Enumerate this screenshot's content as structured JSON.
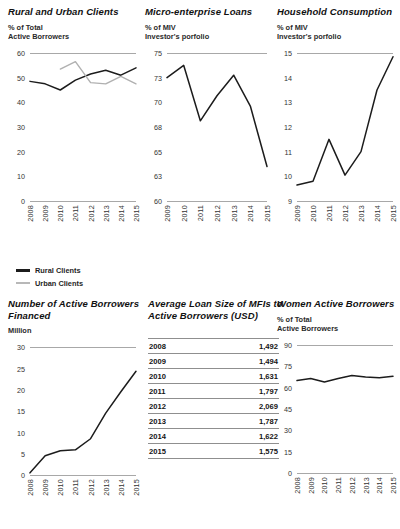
{
  "charts": {
    "rural_urban": {
      "title": "Rural and Urban Clients",
      "subtitle": "% of Total\nActive Borrowers",
      "legend": [
        {
          "label": "Rural Clients",
          "color": "#1c1c1c"
        },
        {
          "label": "Urban Clients",
          "color": "#b0b0b0"
        }
      ]
    },
    "micro_loans": {
      "title": "Micro-enterprise Loans",
      "subtitle": "% of MIV\nInvestor's porfolio"
    },
    "household": {
      "title": "Household Consumption",
      "subtitle": "% of MIV\nInvestor's porfolio"
    },
    "borrowers": {
      "title": "Number of Active Borrowers\nFinanced",
      "subtitle": "Million"
    },
    "women": {
      "title": "Women Active Borrowers",
      "subtitle": "% of Total\nActive Borrowers"
    },
    "loan_size": {
      "title": "Average Loan Size of MFIs to\nActive Borrowers (USD)"
    }
  },
  "chart_data": [
    {
      "id": "rural_urban",
      "type": "line",
      "title": "Rural and Urban Clients",
      "xlabel": "",
      "ylabel": "% of Total Active Borrowers",
      "x": [
        "2008",
        "2009",
        "2010",
        "2011",
        "2012",
        "2013",
        "2014",
        "2015"
      ],
      "yticks": [
        0,
        10,
        20,
        30,
        40,
        50,
        60
      ],
      "ylim": [
        0,
        60
      ],
      "grid": false,
      "legend_position": "below",
      "series": [
        {
          "name": "Rural Clients",
          "color": "#1c1c1c",
          "values": [
            48.5,
            47.5,
            45.0,
            49.0,
            51.5,
            53.0,
            51.0,
            54.0
          ]
        },
        {
          "name": "Urban Clients",
          "color": "#b0b0b0",
          "values": [
            null,
            null,
            53.5,
            56.5,
            48.0,
            47.5,
            50.5,
            47.5
          ]
        }
      ]
    },
    {
      "id": "micro_loans",
      "type": "line",
      "title": "Micro-enterprise Loans",
      "xlabel": "",
      "ylabel": "% of MIV Investor's porfolio",
      "x": [
        "2009",
        "2010",
        "2011",
        "2012",
        "2013",
        "2014",
        "2015"
      ],
      "yticks": [
        60,
        63,
        65,
        68,
        70,
        73,
        75
      ],
      "ylim": [
        60,
        75
      ],
      "grid": false,
      "series": [
        {
          "name": "Micro-enterprise Loans",
          "color": "#1c1c1c",
          "values": [
            73.0,
            74.0,
            68.5,
            70.8,
            73.2,
            69.7,
            63.8
          ]
        }
      ]
    },
    {
      "id": "household",
      "type": "line",
      "title": "Household Consumption",
      "xlabel": "",
      "ylabel": "% of MIV Investor's porfolio",
      "x": [
        "2009",
        "2010",
        "2011",
        "2012",
        "2013",
        "2014",
        "2015"
      ],
      "yticks": [
        9,
        10,
        11,
        12,
        13,
        14,
        15
      ],
      "ylim": [
        9,
        15
      ],
      "grid": false,
      "series": [
        {
          "name": "Household Consumption",
          "color": "#1c1c1c",
          "values": [
            9.65,
            9.8,
            11.5,
            10.05,
            11.0,
            13.5,
            14.85
          ]
        }
      ]
    },
    {
      "id": "borrowers",
      "type": "line",
      "title": "Number of Active Borrowers Financed",
      "xlabel": "",
      "ylabel": "Million",
      "x": [
        "2008",
        "2009",
        "2010",
        "2011",
        "2012",
        "2013",
        "2014",
        "2015"
      ],
      "yticks": [
        0,
        5,
        10,
        15,
        20,
        25,
        30
      ],
      "ylim": [
        0,
        30
      ],
      "grid": false,
      "series": [
        {
          "name": "Active Borrowers Financed",
          "color": "#1c1c1c",
          "values": [
            0.5,
            4.5,
            5.7,
            5.9,
            8.5,
            14.5,
            19.5,
            24.3
          ]
        }
      ]
    },
    {
      "id": "women",
      "type": "line",
      "title": "Women Active Borrowers",
      "xlabel": "",
      "ylabel": "% of Total Active Borrowers",
      "x": [
        "2008",
        "2009",
        "2010",
        "2011",
        "2012",
        "2013",
        "2014",
        "2015"
      ],
      "yticks": [
        0,
        15,
        30,
        45,
        60,
        75,
        90
      ],
      "ylim": [
        0,
        90
      ],
      "grid": false,
      "series": [
        {
          "name": "Women Active Borrowers",
          "color": "#1c1c1c",
          "values": [
            65.0,
            66.5,
            64.0,
            66.5,
            68.5,
            67.5,
            67.0,
            68.0
          ]
        }
      ]
    },
    {
      "id": "loan_size",
      "type": "table",
      "title": "Average Loan Size of MFIs to Active Borrowers (USD)",
      "columns": [
        "Year",
        "Average Loan Size (USD)"
      ],
      "categories": [
        "2008",
        "2009",
        "2010",
        "2011",
        "2012",
        "2013",
        "2014",
        "2015"
      ],
      "values": [
        1492,
        1494,
        1631,
        1797,
        2069,
        1787,
        1622,
        1575
      ],
      "rows": [
        {
          "year": "2008",
          "value": "1,492"
        },
        {
          "year": "2009",
          "value": "1,494"
        },
        {
          "year": "2010",
          "value": "1,631"
        },
        {
          "year": "2011",
          "value": "1,797"
        },
        {
          "year": "2012",
          "value": "2,069"
        },
        {
          "year": "2013",
          "value": "1,787"
        },
        {
          "year": "2014",
          "value": "1,622"
        },
        {
          "year": "2015",
          "value": "1,575"
        }
      ]
    }
  ]
}
